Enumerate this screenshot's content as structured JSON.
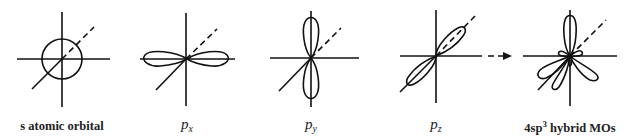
{
  "figure": {
    "stroke_color": "#111111",
    "background": "#ffffff",
    "panels": [
      {
        "id": "s",
        "label_main": "s atomic orbital",
        "label_sub": "",
        "label_sup": "",
        "shape": "sphere",
        "center": [
          62,
          59
        ]
      },
      {
        "id": "px",
        "label_main": "p",
        "label_sub": "x",
        "label_sup": "",
        "shape": "dumbbell-horizontal",
        "center": [
          187,
          59
        ]
      },
      {
        "id": "py",
        "label_main": "p",
        "label_sub": "y",
        "label_sup": "",
        "shape": "dumbbell-vertical",
        "center": [
          311,
          58
        ]
      },
      {
        "id": "pz",
        "label_main": "p",
        "label_sub": "z",
        "label_sup": "",
        "shape": "dumbbell-diagonal",
        "center": [
          436,
          56
        ]
      },
      {
        "id": "sp3",
        "label_prefix": "4sp",
        "label_sup": "3",
        "label_suffix": " hybrid MOs",
        "shape": "tetrahedral-lobes",
        "center": [
          570,
          56
        ]
      }
    ],
    "arrow": {
      "from": [
        488,
        56
      ],
      "to": [
        512,
        56
      ],
      "style": "dashed"
    }
  }
}
